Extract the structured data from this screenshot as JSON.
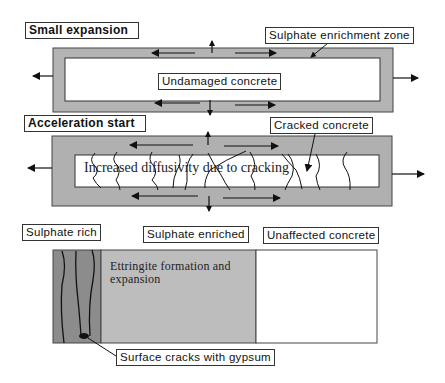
{
  "diagram": {
    "type": "sulphate-attack-stages",
    "colors": {
      "enrichment_zone": "#b4b4b4",
      "sulphate_rich": "#8c8c8c",
      "sulphate_enriched": "#bdbdbd",
      "unaffected": "#ffffff",
      "lines": "#111111"
    },
    "stage1": {
      "title": "Small expansion",
      "zone_label": "Sulphate enrichment zone",
      "core_label": "Undamaged concrete"
    },
    "stage2": {
      "title": "Acceleration start",
      "crack_label": "Cracked concrete",
      "core_text": "Increased diffusivity due to cracking"
    },
    "stage3": {
      "zones": [
        {
          "label": "Sulphate rich"
        },
        {
          "label": "Sulphate enriched"
        },
        {
          "label": "Unaffected concrete"
        }
      ],
      "enriched_text_line1": "Ettringite formation and",
      "enriched_text_line2": "expansion",
      "callout": "Surface cracks with gypsum"
    }
  }
}
